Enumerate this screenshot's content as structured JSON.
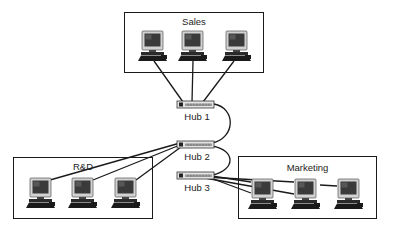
{
  "diagram": {
    "groups": [
      {
        "id": "sales",
        "label": "Sales",
        "box": {
          "x": 124,
          "y": 12,
          "w": 140,
          "h": 61
        }
      },
      {
        "id": "rnd",
        "label": "R&D",
        "box": {
          "x": 13,
          "y": 157,
          "w": 140,
          "h": 62
        }
      },
      {
        "id": "marketing",
        "label": "Marketing",
        "box": {
          "x": 238,
          "y": 156,
          "w": 139,
          "h": 63
        }
      }
    ],
    "hubs": [
      {
        "id": "hub1",
        "label": "Hub 1",
        "x": 177,
        "y": 101
      },
      {
        "id": "hub2",
        "label": "Hub 2",
        "x": 177,
        "y": 141
      },
      {
        "id": "hub3",
        "label": "Hub 3",
        "x": 177,
        "y": 172
      }
    ],
    "computers": {
      "sales": [
        {
          "x": 137,
          "y": 30
        },
        {
          "x": 178,
          "y": 30
        },
        {
          "x": 222,
          "y": 30
        }
      ],
      "rnd": [
        {
          "x": 26,
          "y": 176
        },
        {
          "x": 69,
          "y": 176
        },
        {
          "x": 112,
          "y": 176
        }
      ],
      "marketing": [
        {
          "x": 250,
          "y": 177
        },
        {
          "x": 293,
          "y": 177
        },
        {
          "x": 336,
          "y": 177
        }
      ]
    },
    "colors": {
      "line": "#1a1a1a",
      "monitor_frame": "#cfcfcf",
      "screen": "#3a3a3a",
      "keyboard": "#1a1a1a",
      "hub_body": "#e4e4e4"
    }
  }
}
